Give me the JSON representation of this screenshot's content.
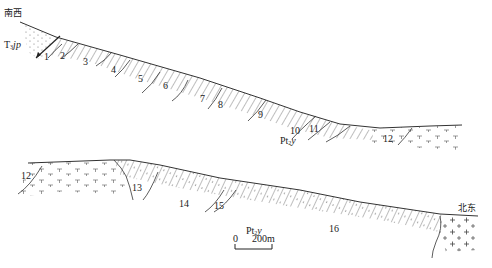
{
  "diagram": {
    "type": "geological-cross-section",
    "upper_section": {
      "start_direction": "南西",
      "formation_left": {
        "prefix": "T",
        "sub": "3",
        "suffix": "jp"
      },
      "formation_center": {
        "prefix": "Pt",
        "sub": "2",
        "suffix": "y"
      },
      "unit_labels": [
        "1",
        "2",
        "3",
        "4",
        "5",
        "6",
        "7",
        "8",
        "9",
        "10",
        "11",
        "12"
      ]
    },
    "lower_section": {
      "end_direction": "北东",
      "formation_center": {
        "prefix": "Pt",
        "sub": "2",
        "suffix": "y"
      },
      "unit_labels": [
        "12",
        "13",
        "14",
        "15",
        "16"
      ]
    },
    "scale_bar": {
      "start": "0",
      "end": "200m"
    },
    "colors": {
      "line": "#333333",
      "text": "#222222",
      "background": "#ffffff"
    }
  }
}
